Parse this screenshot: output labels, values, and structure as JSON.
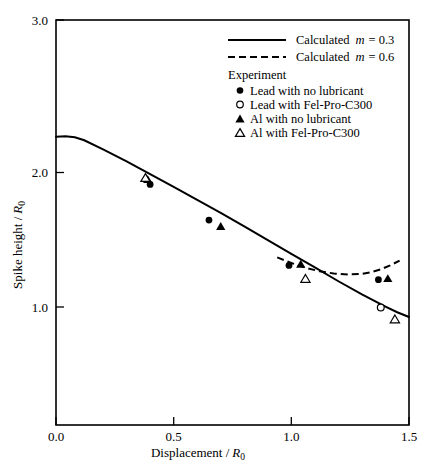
{
  "chart_data": {
    "type": "scatter",
    "title": "",
    "xlabel": "Displacement / R0",
    "xlabel_main": "Displacement /",
    "xlabel_var": "R",
    "xlabel_sub": "0",
    "ylabel": "Spike height / R0",
    "ylabel_main": "Spike height /",
    "ylabel_var": "R",
    "ylabel_sub": "0",
    "xlim": [
      0.0,
      1.5
    ],
    "ylim": [
      1.0,
      3.0
    ],
    "xticks": [
      0.0,
      0.5,
      1.0,
      1.5
    ],
    "xtick_labels": [
      "0.0",
      "0.5",
      "1.0",
      "1.5"
    ],
    "yticks": [
      1.0,
      2.0,
      3.0
    ],
    "ytick_labels": [
      "1.0",
      "2.0",
      "3.0"
    ],
    "grid": false,
    "legend_position": "top-right",
    "series": [
      {
        "name": "Calculated m = 0.3",
        "style": "solid-line",
        "points": [
          [
            0.0,
            2.265
          ],
          [
            0.04,
            2.268
          ],
          [
            0.08,
            2.262
          ],
          [
            0.12,
            2.243
          ],
          [
            0.2,
            2.185
          ],
          [
            0.3,
            2.11
          ],
          [
            0.4,
            2.03
          ],
          [
            0.5,
            1.95
          ],
          [
            0.6,
            1.868
          ],
          [
            0.7,
            1.786
          ],
          [
            0.8,
            1.7
          ],
          [
            0.9,
            1.614
          ],
          [
            1.0,
            1.528
          ],
          [
            1.1,
            1.442
          ],
          [
            1.2,
            1.355
          ],
          [
            1.3,
            1.272
          ],
          [
            1.4,
            1.196
          ],
          [
            1.45,
            1.16
          ],
          [
            1.5,
            1.13
          ]
        ]
      },
      {
        "name": "Calculated m = 0.6",
        "style": "dashed-line",
        "points": [
          [
            0.94,
            1.505
          ],
          [
            1.0,
            1.47
          ],
          [
            1.06,
            1.44
          ],
          [
            1.12,
            1.418
          ],
          [
            1.18,
            1.404
          ],
          [
            1.24,
            1.398
          ],
          [
            1.3,
            1.402
          ],
          [
            1.34,
            1.412
          ],
          [
            1.38,
            1.43
          ],
          [
            1.42,
            1.455
          ],
          [
            1.46,
            1.485
          ]
        ]
      },
      {
        "name": "Lead with no lubricant",
        "style": "filled-circle",
        "points": [
          [
            0.4,
            1.965
          ],
          [
            0.65,
            1.74
          ],
          [
            0.99,
            1.455
          ],
          [
            1.37,
            1.365
          ]
        ]
      },
      {
        "name": "Lead with Fel-Pro-C300",
        "style": "open-circle",
        "points": [
          [
            1.38,
            1.19
          ]
        ]
      },
      {
        "name": "Al with no lubricant",
        "style": "filled-triangle",
        "points": [
          [
            0.39,
            1.995
          ],
          [
            0.7,
            1.7
          ],
          [
            1.04,
            1.462
          ],
          [
            1.41,
            1.372
          ]
        ]
      },
      {
        "name": "Al with Fel-Pro-C300",
        "style": "open-triangle",
        "points": [
          [
            0.38,
            2.005
          ],
          [
            1.06,
            1.37
          ],
          [
            1.44,
            1.115
          ]
        ]
      }
    ],
    "legend": {
      "header_experiment": "Experiment",
      "entries": [
        {
          "label_prefix": "Calculated",
          "label_var": "m",
          "label_value": "= 0.3",
          "marker": "solid-line"
        },
        {
          "label_prefix": "Calculated",
          "label_var": "m",
          "label_value": "= 0.6",
          "marker": "dashed-line"
        },
        {
          "label_prefix": "Lead with no lubricant",
          "label_var": "",
          "label_value": "",
          "marker": "filled-circle"
        },
        {
          "label_prefix": "Lead with Fel-Pro-C300",
          "label_var": "",
          "label_value": "",
          "marker": "open-circle"
        },
        {
          "label_prefix": "Al with no lubricant",
          "label_var": "",
          "label_value": "",
          "marker": "filled-triangle"
        },
        {
          "label_prefix": "Al with Fel-Pro-C300",
          "label_var": "",
          "label_value": "",
          "marker": "open-triangle"
        }
      ]
    },
    "colors": {
      "line": "#000000",
      "marker_fill": "#000000",
      "marker_open_fill": "#ffffff",
      "background": "#ffffff",
      "axis": "#000000"
    }
  }
}
